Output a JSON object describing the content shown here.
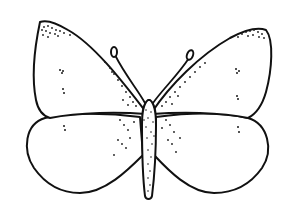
{
  "image": {
    "subject": "butterfly",
    "style": "black ink line drawing with stippling",
    "background": "#ffffff",
    "ink": "#111111",
    "width": 296,
    "height": 222
  },
  "parts": {
    "forewings": [
      "left-forewing",
      "right-forewing"
    ],
    "hindwings": [
      "left-hindwing",
      "right-hindwing"
    ],
    "body": "stippled-body",
    "antennae": [
      "left-antenna",
      "right-antenna"
    ]
  }
}
